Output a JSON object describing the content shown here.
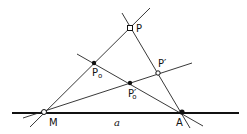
{
  "diagram": {
    "title": "",
    "baseline_label": "a",
    "points": {
      "M": {
        "label": "M",
        "style": "open-circle"
      },
      "A": {
        "label": "A",
        "style": "filled-dot"
      },
      "P": {
        "label": "P",
        "style": "open-square"
      },
      "P0": {
        "label": "P",
        "subscript": "o",
        "style": "filled-dot"
      },
      "Pprime": {
        "label": "P′",
        "style": "open-circle"
      },
      "P0prime": {
        "label": "P′",
        "subscript": "o",
        "style": "filled-dot"
      }
    },
    "colors": {
      "ink": "#111111",
      "background": "#ffffff"
    }
  }
}
